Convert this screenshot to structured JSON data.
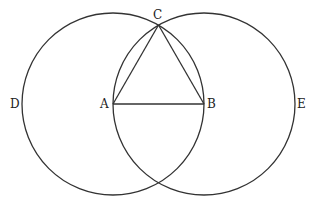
{
  "diagram": {
    "points": {
      "A": {
        "label": "A",
        "x": 113,
        "y": 104
      },
      "B": {
        "label": "B",
        "x": 204,
        "y": 104
      },
      "C": {
        "label": "C",
        "x": 158.5,
        "y": 25
      },
      "D": {
        "label": "D",
        "x": 22,
        "y": 104
      },
      "E": {
        "label": "E",
        "x": 295,
        "y": 104
      }
    },
    "circles": [
      {
        "name": "circle-centered-A",
        "cx": 113,
        "cy": 104,
        "r": 91
      },
      {
        "name": "circle-centered-B",
        "cx": 204,
        "cy": 104,
        "r": 91
      }
    ],
    "segments": [
      [
        "A",
        "B"
      ],
      [
        "A",
        "C"
      ],
      [
        "B",
        "C"
      ]
    ],
    "stroke_color": "#333333"
  }
}
